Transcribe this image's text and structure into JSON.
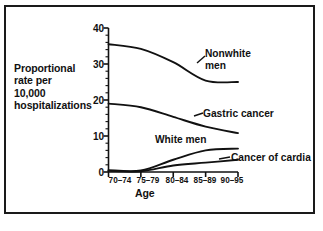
{
  "figure": {
    "background_color": "#ffffff",
    "border_color": "#1a1a1a"
  },
  "chart_data": {
    "type": "line",
    "title": "",
    "xlabel": "Age",
    "ylabel": "Proportional rate per 10,000 hospitalizations",
    "ylabel_lines": [
      "Proportional",
      "rate per",
      "10,000",
      "hospitalizations"
    ],
    "categories": [
      "70–74",
      "75–79",
      "80–84",
      "85–89",
      "90–95"
    ],
    "xlim": [
      0,
      4
    ],
    "ylim": [
      0,
      40
    ],
    "yticks": [
      0,
      10,
      20,
      30,
      40
    ],
    "ytick_labels": [
      "0",
      "10",
      "20",
      "30",
      "40"
    ],
    "minor_tick_step": 2,
    "grid": false,
    "legend": "inline-annotations",
    "line_color": "#111111",
    "series": [
      {
        "name": "Nonwhite men",
        "label": "Nonwhite\nmen",
        "label_lines": [
          "Nonwhite",
          "men"
        ],
        "values": [
          35.5,
          34.2,
          30.5,
          25.4,
          25.0
        ]
      },
      {
        "name": "Gastric cancer",
        "label": "Gastric cancer",
        "label_lines": [
          "Gastric cancer"
        ],
        "values": [
          19.0,
          18.0,
          15.3,
          12.6,
          10.8
        ]
      },
      {
        "name": "White men",
        "label": "White men",
        "label_lines": [
          "White men"
        ],
        "values": [
          0.5,
          0.4,
          3.4,
          6.0,
          6.5
        ]
      },
      {
        "name": "Cancer of cardia",
        "label": "Cancer of cardia",
        "label_lines": [
          "Cancer of cardia"
        ],
        "values": [
          0.3,
          0.2,
          1.8,
          2.6,
          3.4
        ]
      }
    ]
  }
}
